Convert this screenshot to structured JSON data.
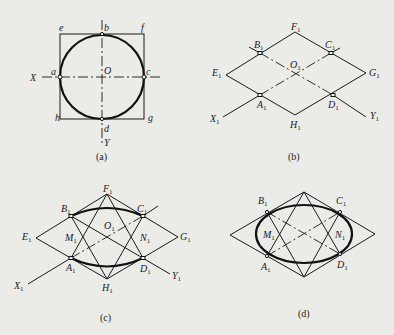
{
  "figure": {
    "panels": [
      {
        "id": "a",
        "caption": "(a)",
        "labels": {
          "X": "X",
          "Y": "Y",
          "O": "O",
          "a": "a",
          "b": "b",
          "c": "c",
          "d": "d",
          "e": "e",
          "f": "f",
          "g": "g",
          "h": "h"
        }
      },
      {
        "id": "b",
        "caption": "(b)",
        "labels": {
          "A": "A",
          "B": "B",
          "C": "C",
          "D": "D",
          "E": "E",
          "F": "F",
          "G": "G",
          "H": "H",
          "O": "O",
          "X": "X",
          "Y": "Y",
          "sub": "1"
        }
      },
      {
        "id": "c",
        "caption": "(c)",
        "labels": {
          "A": "A",
          "B": "B",
          "C": "C",
          "D": "D",
          "E": "E",
          "F": "F",
          "G": "G",
          "H": "H",
          "O": "O",
          "X": "X",
          "Y": "Y",
          "M": "M",
          "N": "N",
          "sub": "1"
        }
      },
      {
        "id": "d",
        "caption": "(d)",
        "labels": {
          "A": "A",
          "B": "B",
          "C": "C",
          "D": "D",
          "M": "M",
          "N": "N",
          "sub": "1"
        }
      }
    ]
  }
}
